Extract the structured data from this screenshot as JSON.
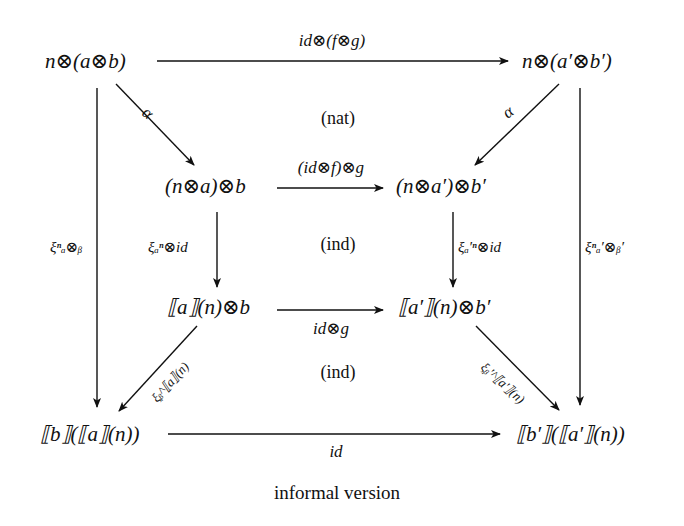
{
  "diagram": {
    "type": "commutative-diagram",
    "nodes": {
      "top_left": "n⊗(a⊗b)",
      "top_right": "n⊗(a′⊗b′)",
      "mid_left": "(n⊗a)⊗b",
      "mid_right": "(n⊗a′)⊗b′",
      "row3_left": "⟦a⟧(n)⊗b",
      "row3_right": "⟦a′⟧(n)⊗b′",
      "bottom_left": "⟦b⟧(⟦a⟧(n))",
      "bottom_right": "⟦b′⟧(⟦a′⟧(n))"
    },
    "edges": {
      "top": "id⊗(f⊗g)",
      "alpha_left": "α",
      "alpha_right": "α",
      "mid": "(id⊗f)⊗g",
      "inner_left": "ξₐⁿ⊗id",
      "inner_right": "ξₐ′ⁿ⊗id",
      "outer_left": "ξⁿₐ⊗ᵦ",
      "outer_right": "ξⁿₐ′⊗ᵦ′",
      "row3": "id⊗g",
      "diag_left": "ξᵦ^⟦a⟧(n)",
      "diag_right": "ξᵦ′^⟦a′⟧(n)",
      "bottom": "id"
    },
    "regions": {
      "nat": "(nat)",
      "ind_upper": "(ind)",
      "ind_lower": "(ind)"
    },
    "caption": "informal version"
  }
}
